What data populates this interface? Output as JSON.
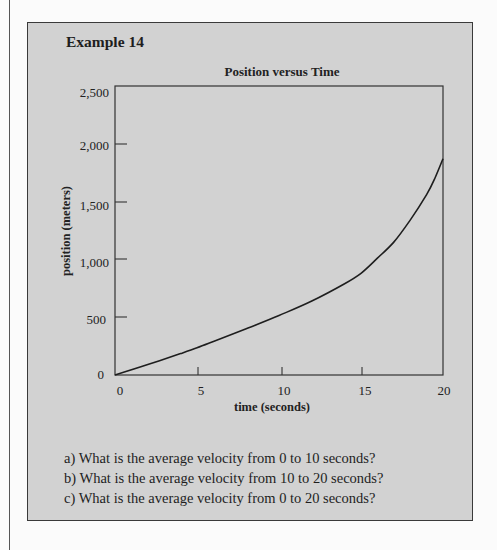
{
  "example": {
    "title": "Example 14"
  },
  "chart_data": {
    "type": "line",
    "title": "Position versus Time",
    "xlabel": "time (seconds)",
    "ylabel": "position (meters)",
    "xlim": [
      0,
      20
    ],
    "ylim": [
      0,
      2500
    ],
    "xticks": [
      0,
      5,
      10,
      15,
      20
    ],
    "xtick_labels": [
      "0",
      "5",
      "10",
      "15",
      "20"
    ],
    "yticks": [
      0,
      500,
      1000,
      1500,
      2000,
      2500
    ],
    "ytick_labels": [
      "0",
      "500",
      "1,000",
      "1,500",
      "2,000",
      "2,500"
    ],
    "grid": false,
    "legend": null,
    "series": [
      {
        "name": "position",
        "x": [
          0,
          2,
          4,
          5,
          6,
          8,
          10,
          12,
          14,
          15,
          16,
          17,
          18,
          19,
          19.5,
          20
        ],
        "y": [
          0,
          90,
          185,
          235,
          290,
          400,
          515,
          640,
          790,
          880,
          1010,
          1150,
          1340,
          1560,
          1700,
          1870
        ]
      }
    ]
  },
  "questions": [
    "a) What is the average velocity from 0 to 10 seconds?",
    "b) What is the average velocity from 10 to 20 seconds?",
    "c) What is the average velocity from 0 to 20 seconds?"
  ],
  "colors": {
    "box_fill": "#d2d2d2",
    "box_border": "#3a3a3a",
    "page_bg": "#fbfbfb",
    "curve": "#1e1e1e"
  }
}
